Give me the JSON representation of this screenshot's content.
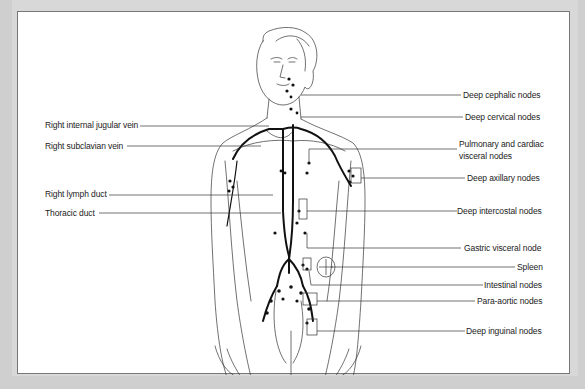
{
  "diagram": {
    "left_labels": [
      {
        "id": "right-internal-jugular-vein",
        "text": "Right internal jugular vein"
      },
      {
        "id": "right-subclavian-vein",
        "text": "Right subclavian vein"
      },
      {
        "id": "right-lymph-duct",
        "text": "Right lymph duct"
      },
      {
        "id": "thoracic-duct",
        "text": "Thoracic duct"
      }
    ],
    "right_labels": [
      {
        "id": "deep-cephalic-nodes",
        "text": "Deep cephalic nodes"
      },
      {
        "id": "deep-cervical-nodes",
        "text": "Deep cervical nodes"
      },
      {
        "id": "pulmonary-cardiac-visceral-nodes",
        "text": "Pulmonary and cardiac visceral nodes"
      },
      {
        "id": "deep-axillary-nodes",
        "text": "Deep axillary nodes"
      },
      {
        "id": "deep-intercostal-nodes",
        "text": "Deep intercostal nodes"
      },
      {
        "id": "gastric-visceral-node",
        "text": "Gastric visceral node"
      },
      {
        "id": "spleen",
        "text": "Spleen"
      },
      {
        "id": "intestinal-nodes",
        "text": "Intestinal nodes"
      },
      {
        "id": "para-aortic-nodes",
        "text": "Para-aortic nodes"
      },
      {
        "id": "deep-inguinal-nodes",
        "text": "Deep inguinal nodes"
      }
    ]
  }
}
